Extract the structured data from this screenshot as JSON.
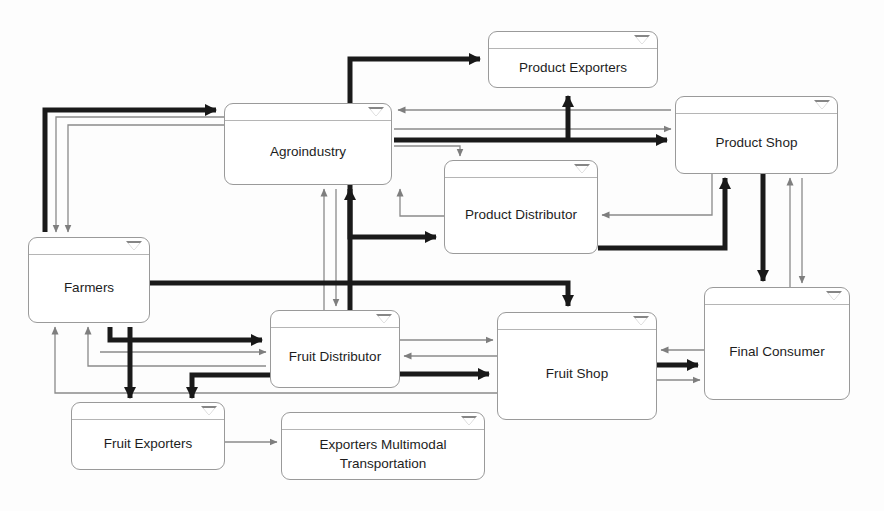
{
  "diagram": {
    "canvas": {
      "width": 884,
      "height": 511,
      "background": "#fdfdfd"
    },
    "colors": {
      "node_border": "#9a9a9a",
      "node_fill": "#ffffff",
      "thin_flow": "#8a8a8a",
      "thick_flow": "#1a1a1a",
      "text": "#1d1d1d"
    },
    "legend": {
      "thin_line_meaning": "thin gray flow",
      "thick_line_meaning": "thick black flow"
    },
    "nodes": [
      {
        "id": "agroindustry",
        "label": "Agroindustry",
        "x": 224,
        "y": 103,
        "w": 168,
        "h": 82,
        "icon": "collapse-triangle-icon"
      },
      {
        "id": "product-exporters",
        "label": "Product Exporters",
        "x": 488,
        "y": 31,
        "w": 170,
        "h": 57,
        "icon": "collapse-triangle-icon"
      },
      {
        "id": "product-shop",
        "label": "Product Shop",
        "x": 675,
        "y": 96,
        "w": 163,
        "h": 78,
        "icon": "collapse-triangle-icon"
      },
      {
        "id": "product-distributor",
        "label": "Product Distributor",
        "x": 444,
        "y": 160,
        "w": 154,
        "h": 94,
        "icon": "collapse-triangle-icon"
      },
      {
        "id": "farmers",
        "label": "Farmers",
        "x": 28,
        "y": 237,
        "w": 122,
        "h": 86,
        "icon": "collapse-triangle-icon"
      },
      {
        "id": "fruit-distributor",
        "label": "Fruit Distributor",
        "x": 270,
        "y": 310,
        "w": 130,
        "h": 78,
        "icon": "collapse-triangle-icon"
      },
      {
        "id": "fruit-shop",
        "label": "Fruit Shop",
        "x": 497,
        "y": 312,
        "w": 160,
        "h": 108,
        "icon": "collapse-triangle-icon"
      },
      {
        "id": "final-consumer",
        "label": "Final Consumer",
        "x": 704,
        "y": 287,
        "w": 146,
        "h": 113,
        "icon": "collapse-triangle-icon"
      },
      {
        "id": "fruit-exporters",
        "label": "Fruit Exporters",
        "x": 71,
        "y": 402,
        "w": 154,
        "h": 68,
        "icon": "collapse-triangle-icon"
      },
      {
        "id": "exporters-multimodal",
        "label": "Exporters Multimodal Transportation",
        "x": 281,
        "y": 412,
        "w": 204,
        "h": 68,
        "icon": "collapse-triangle-icon"
      }
    ],
    "edges": [
      {
        "from": "farmers",
        "to": "agroindustry",
        "weight": "thick"
      },
      {
        "from": "agroindustry",
        "to": "farmers",
        "weight": "thin"
      },
      {
        "from": "agroindustry",
        "to": "farmers",
        "weight": "thin"
      },
      {
        "from": "agroindustry",
        "to": "product-exporters",
        "weight": "thick"
      },
      {
        "from": "product-shop",
        "to": "product-exporters",
        "weight": "thick"
      },
      {
        "from": "product-shop",
        "to": "agroindustry",
        "weight": "thin"
      },
      {
        "from": "agroindustry",
        "to": "product-shop",
        "weight": "thin"
      },
      {
        "from": "agroindustry",
        "to": "product-shop",
        "weight": "thick"
      },
      {
        "from": "agroindustry",
        "to": "product-distributor",
        "weight": "thin"
      },
      {
        "from": "agroindustry",
        "to": "product-distributor",
        "weight": "thick"
      },
      {
        "from": "product-distributor",
        "to": "agroindustry",
        "weight": "thin"
      },
      {
        "from": "product-shop",
        "to": "product-distributor",
        "weight": "thin"
      },
      {
        "from": "product-distributor",
        "to": "product-shop",
        "weight": "thick"
      },
      {
        "from": "farmers",
        "to": "fruit-distributor",
        "weight": "thick"
      },
      {
        "from": "farmers",
        "to": "fruit-distributor",
        "weight": "thin"
      },
      {
        "from": "fruit-distributor",
        "to": "farmers",
        "weight": "thin"
      },
      {
        "from": "farmers",
        "to": "fruit-exporters",
        "weight": "thick"
      },
      {
        "from": "fruit-distributor",
        "to": "fruit-exporters",
        "weight": "thick"
      },
      {
        "from": "fruit-exporters",
        "to": "exporters-multimodal",
        "weight": "thin"
      },
      {
        "from": "fruit-distributor",
        "to": "fruit-shop",
        "weight": "thin"
      },
      {
        "from": "fruit-shop",
        "to": "fruit-distributor",
        "weight": "thin"
      },
      {
        "from": "fruit-distributor",
        "to": "fruit-shop",
        "weight": "thick"
      },
      {
        "from": "farmers",
        "to": "fruit-shop",
        "weight": "thick"
      },
      {
        "from": "fruit-shop",
        "to": "farmers",
        "weight": "thin"
      },
      {
        "from": "fruit-shop",
        "to": "final-consumer",
        "weight": "thick"
      },
      {
        "from": "final-consumer",
        "to": "fruit-shop",
        "weight": "thin"
      },
      {
        "from": "fruit-shop",
        "to": "final-consumer",
        "weight": "thin"
      },
      {
        "from": "product-shop",
        "to": "final-consumer",
        "weight": "thick"
      },
      {
        "from": "final-consumer",
        "to": "product-shop",
        "weight": "thin"
      },
      {
        "from": "product-shop",
        "to": "final-consumer",
        "weight": "thin"
      }
    ]
  }
}
